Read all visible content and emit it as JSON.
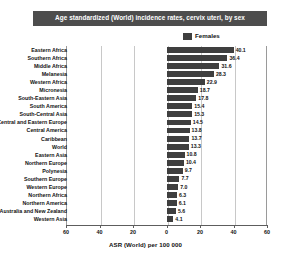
{
  "chart_data": {
    "type": "bar",
    "orientation": "horizontal",
    "title": "Age standardized (World) incidence rates, cervix uteri, by sex",
    "xlabel": "ASR (World) per 100 000",
    "ylabel": "",
    "legend": [
      {
        "name": "Females",
        "color": "#3f3f3f"
      }
    ],
    "legend_position": "top-right",
    "grid": true,
    "xlim": [
      -60,
      60
    ],
    "xticks": [
      -60,
      -40,
      -20,
      0,
      20,
      40,
      60
    ],
    "xtick_labels": [
      "60",
      "40",
      "20",
      "0",
      "20",
      "40",
      "60"
    ],
    "categories": [
      "Eastern Africa",
      "Southern Africa",
      "Middle Africa",
      "Melanesia",
      "Western Africa",
      "Micronesia",
      "South-Eastern Asia",
      "South America",
      "South-Central Asia",
      "Central and Eastern Europe",
      "Central America",
      "Caribbean",
      "World",
      "Eastern Asia",
      "Northern Europe",
      "Polynesia",
      "Southern Europe",
      "Western Europe",
      "Northern Africa",
      "Northern America",
      "Australia and New Zealand",
      "Western Asia"
    ],
    "series": [
      {
        "name": "Females",
        "values": [
          40.1,
          36.4,
          31.6,
          28.3,
          22.9,
          18.7,
          17.8,
          15.4,
          15.3,
          14.5,
          13.8,
          13.7,
          13.3,
          10.8,
          10.4,
          9.7,
          7.7,
          7.0,
          6.3,
          6.1,
          5.6,
          4.1
        ]
      }
    ],
    "value_labels": [
      "40.1",
      "36.4",
      "31.6",
      "28.3",
      "22.9",
      "18.7",
      "17.8",
      "15.4",
      "15.3",
      "14.5",
      "13.8",
      "13.7",
      "13.3",
      "10.8",
      "10.4",
      "9.7",
      "7.7",
      "7.0",
      "6.3",
      "6.1",
      "5.6",
      "4.1"
    ]
  },
  "title_banner": {
    "text": "Age standardized (World) incidence rates, cervix uteri, by sex",
    "background": "#4d4d4d",
    "text_color": "#ffffff"
  },
  "legend": {
    "items": [
      {
        "label": "Females",
        "swatch_color": "#3f3f3f",
        "swatch_name": "females-swatch"
      }
    ]
  },
  "axis": {
    "x_title": "ASR (World) per 100 000",
    "tick_labels": [
      "60",
      "40",
      "20",
      "0",
      "20",
      "40",
      "60"
    ]
  }
}
